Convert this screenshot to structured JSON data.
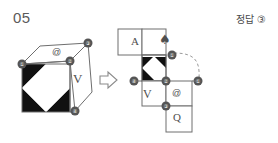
{
  "page": {
    "question_number": "05",
    "answer_prefix": "정답",
    "answer_choice": "③"
  },
  "cube": {
    "label": "isometric-cube",
    "face_glyphs": {
      "top": "@",
      "right": "V",
      "front": "octagon-pattern"
    },
    "vertex_markers": [
      {
        "id": "1",
        "label": "①",
        "x": 22,
        "y": 64
      },
      {
        "id": "2",
        "label": "②",
        "x": 70,
        "y": 61
      },
      {
        "id": "3",
        "label": "③",
        "x": 88,
        "y": 43
      },
      {
        "id": "4",
        "label": "④",
        "x": 75,
        "y": 111
      }
    ]
  },
  "arrow": {
    "label": "⇒",
    "direction": "right"
  },
  "net": {
    "label": "cube-net-unfolded",
    "cells": [
      {
        "id": "cell-A",
        "glyph": "A",
        "col": 0,
        "row": 0
      },
      {
        "id": "cell-spade",
        "glyph": "♠",
        "col": 1,
        "row": 0
      },
      {
        "id": "cell-pattern",
        "glyph": "octagon-pattern",
        "col": 1,
        "row": 1
      },
      {
        "id": "cell-V",
        "glyph": "V",
        "col": 1,
        "row": 2
      },
      {
        "id": "cell-at",
        "glyph": "@",
        "col": 2,
        "row": 2
      },
      {
        "id": "cell-Q",
        "glyph": "Q",
        "col": 2,
        "row": 3
      }
    ],
    "vertex_markers": [
      {
        "id": "1a",
        "label": "①",
        "x": 172,
        "y": 55
      },
      {
        "id": "4",
        "label": "④",
        "x": 134,
        "y": 81
      },
      {
        "id": "2",
        "label": "②",
        "x": 166,
        "y": 81
      },
      {
        "id": "1b",
        "label": "①",
        "x": 198,
        "y": 81
      },
      {
        "id": "3",
        "label": "③",
        "x": 166,
        "y": 106
      }
    ],
    "fold_arc": "dashed-arc"
  },
  "colors": {
    "ink": "#4f4f4f",
    "line": "#6e6e6e",
    "fill_black": "#111111",
    "marker": "#555555",
    "background": "#ffffff"
  }
}
